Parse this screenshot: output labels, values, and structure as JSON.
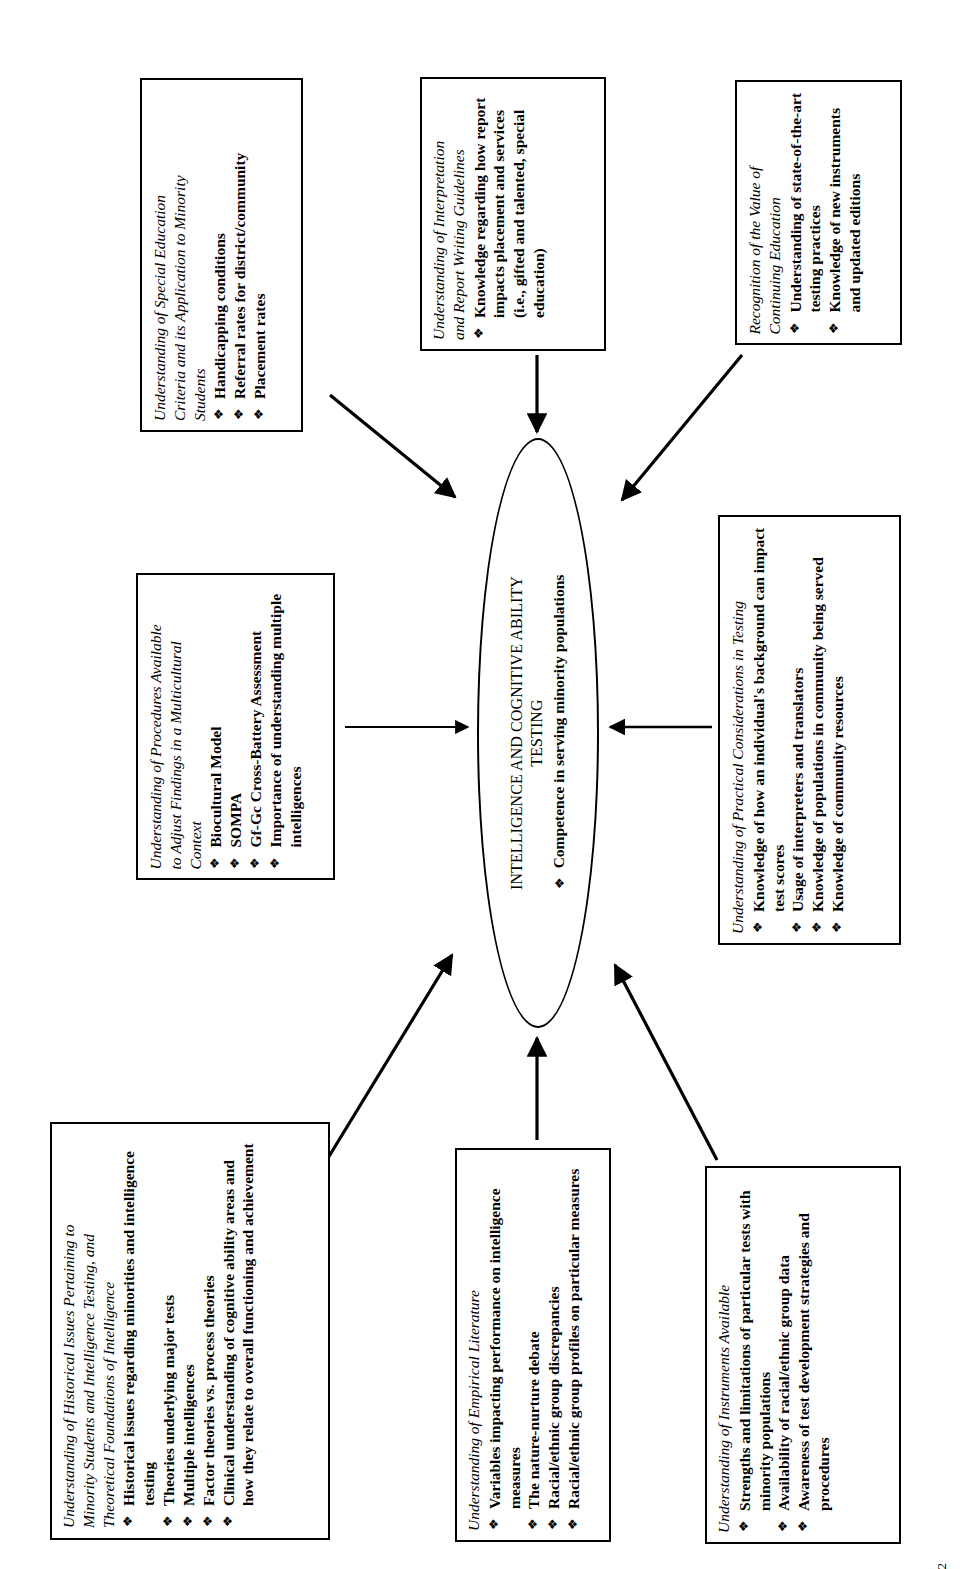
{
  "document": {
    "page_number": "2",
    "orientation": "text rotated 90 degrees counter-clockwise",
    "bullet_glyph": "❖"
  },
  "center": {
    "title": "INTELLIGENCE AND COGNITIVE ABILITY\nTESTING",
    "bullets": [
      "Competence in serving minority populations"
    ]
  },
  "boxes": [
    {
      "id": "special-education",
      "title": "Understanding of Special Education\nCriteria and its Application to Minority\nStudents",
      "bullets": [
        "Handicapping conditions",
        "Referral rates for district/community",
        "Placement rates"
      ]
    },
    {
      "id": "interpretation-report-writing",
      "title": "Understanding of Interpretation\nand Report Writing Guidelines",
      "bullets": [
        "Knowledge regarding how report impacts placement and services (i.e., gifted and talented, special education)"
      ]
    },
    {
      "id": "continuing-education",
      "title": "Recognition of the Value of\nContinuing Education",
      "bullets": [
        "Understanding of state-of-the-art testing practices",
        "Knowledge of new instruments and updated editions"
      ]
    },
    {
      "id": "procedures-multicultural",
      "title": "Understanding of Procedures Available\nto Adjust Findings in a Multicultural\nContext",
      "bullets": [
        "Biocultural Model",
        "SOMPA",
        "Gf-Gc Cross-Battery Assessment",
        "Importance of understanding multiple intelligences"
      ]
    },
    {
      "id": "practical-considerations",
      "title": "Understanding of Practical Considerations in Testing",
      "bullets": [
        "Knowledge of how an individual's background can impact test scores",
        "Usage of interpreters and translators",
        "Knowledge of populations in community being served",
        "Knowledge of community resources"
      ]
    },
    {
      "id": "historical-issues",
      "title": "Understanding of Historical Issues Pertaining to\nMinority Students and Intelligence Testing, and\nTheoretical Foundations of Intelligence",
      "bullets": [
        "Historical issues regarding minorities and intelligence testing",
        "Theories underlying major tests",
        "Multiple intelligences",
        "Factor theories vs. process theories",
        "Clinical understanding of cognitive ability areas and how they relate to overall functioning and achievement"
      ]
    },
    {
      "id": "empirical-literature",
      "title": "Understanding of Empirical Literature",
      "bullets": [
        "Variables impacting performance on intelligence measures",
        "The nature-nurture debate",
        "Racial/ethnic group discrepancies",
        "Racial/ethnic group profiles on particular measures"
      ]
    },
    {
      "id": "instruments-available",
      "title": "Understanding of Instruments Available",
      "bullets": [
        "Strengths and limitations of particular tests with minority populations",
        "Availability of racial/ethnic group data",
        "Awareness of test development strategies and procedures"
      ]
    }
  ],
  "arrows": [
    {
      "name": "arrow-special-education-to-center",
      "from": "special-education"
    },
    {
      "name": "arrow-interpretation-to-center",
      "from": "interpretation-report-writing"
    },
    {
      "name": "arrow-continuing-education-to-center",
      "from": "continuing-education"
    },
    {
      "name": "arrow-procedures-to-center",
      "from": "procedures-multicultural"
    },
    {
      "name": "arrow-practical-to-center",
      "from": "practical-considerations"
    },
    {
      "name": "arrow-historical-to-center",
      "from": "historical-issues"
    },
    {
      "name": "arrow-empirical-to-center",
      "from": "empirical-literature"
    },
    {
      "name": "arrow-instruments-to-center",
      "from": "instruments-available"
    }
  ],
  "colors": {
    "ink": "#000000",
    "background": "#ffffff"
  }
}
